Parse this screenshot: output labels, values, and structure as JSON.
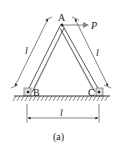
{
  "figure": {
    "caption": "(a)",
    "labels": {
      "apex": "A",
      "left_support": "B",
      "right_support": "C",
      "force": "P",
      "left_length": "l",
      "right_length": "l",
      "base_length": "l"
    },
    "colors": {
      "line": "#333333",
      "force_arrow": "#888888",
      "hatch": "#555555"
    }
  }
}
